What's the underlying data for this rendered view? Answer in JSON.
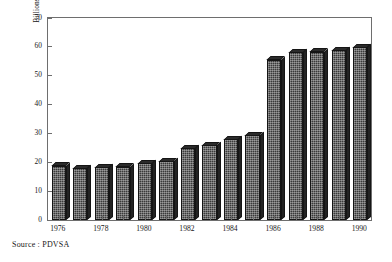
{
  "chart_data": {
    "type": "bar",
    "title": "",
    "subtitle": "",
    "xlabel": "",
    "ylabel": "Billions of Barrels",
    "ylim": [
      0,
      70
    ],
    "ytick_step": 10,
    "yticks": [
      0,
      10,
      20,
      30,
      40,
      50,
      60,
      70
    ],
    "ytick_labels": [
      "0",
      "10",
      "20",
      "30",
      "40",
      "50",
      "60",
      "70"
    ],
    "grid": false,
    "legend": null,
    "categories": [
      "1976",
      "1977",
      "1978",
      "1979",
      "1980",
      "1981",
      "1982",
      "1983",
      "1984",
      "1985",
      "1986",
      "1987",
      "1988",
      "1989",
      "1990"
    ],
    "xtick_labels": [
      "1976",
      "1978",
      "1980",
      "1982",
      "1984",
      "1986",
      "1988",
      "1990"
    ],
    "xtick_categories": [
      "1976",
      "1978",
      "1980",
      "1982",
      "1984",
      "1986",
      "1988",
      "1990"
    ],
    "values": [
      18.8,
      18.0,
      18.2,
      18.5,
      19.7,
      20.3,
      24.8,
      25.9,
      28.0,
      29.3,
      55.5,
      58.1,
      58.3,
      58.9,
      59.9
    ],
    "series": [
      {
        "name": "Reserves",
        "values": [
          18.8,
          18.0,
          18.2,
          18.5,
          19.7,
          20.3,
          24.8,
          25.9,
          28.0,
          29.3,
          55.5,
          58.1,
          58.3,
          58.9,
          59.9
        ]
      }
    ],
    "bar_color": "#3a3a3a",
    "bar_edge_color": "#151515",
    "axis_color": "#6e6e6e",
    "background_color": "#ffffff",
    "text_color": "#171717"
  },
  "caption": {
    "source": "Source : PDVSA"
  }
}
